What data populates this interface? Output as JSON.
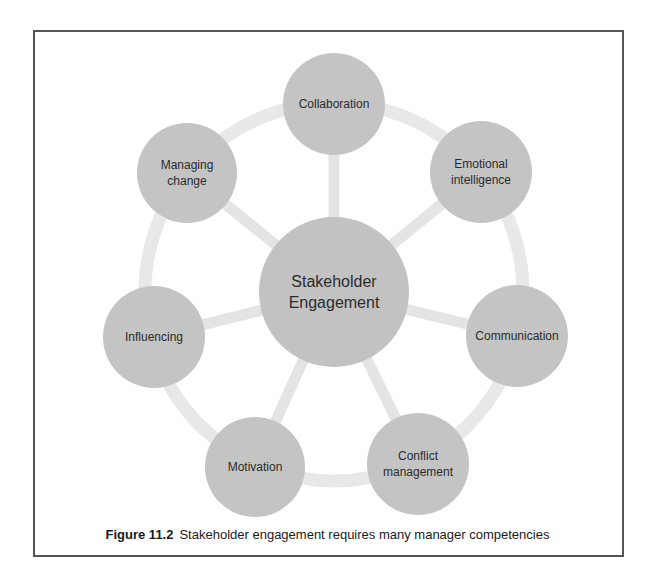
{
  "diagram": {
    "type": "hub-and-spoke",
    "center_node": {
      "label": "Stakeholder\nEngagement",
      "cx": 334,
      "cy": 292,
      "r": 75
    },
    "ring": {
      "cx": 334,
      "cy": 292,
      "r": 189,
      "stroke_width": 13
    },
    "nodes": [
      {
        "id": "collaboration",
        "label": "Collaboration",
        "cx": 334,
        "cy": 104,
        "r": 51
      },
      {
        "id": "emotional-intelligence",
        "label": "Emotional\nintelligence",
        "cx": 481,
        "cy": 172,
        "r": 51
      },
      {
        "id": "communication",
        "label": "Communication",
        "cx": 517,
        "cy": 336,
        "r": 51
      },
      {
        "id": "conflict-management",
        "label": "Conflict\nmanagement",
        "cx": 418,
        "cy": 464,
        "r": 51
      },
      {
        "id": "motivation",
        "label": "Motivation",
        "cx": 255,
        "cy": 467,
        "r": 50
      },
      {
        "id": "influencing",
        "label": "Influencing",
        "cx": 154,
        "cy": 337,
        "r": 51
      },
      {
        "id": "managing-change",
        "label": "Managing\nchange",
        "cx": 187,
        "cy": 173,
        "r": 50
      }
    ],
    "colors": {
      "node_fill": "#c4c4c4",
      "center_fill": "#c2c2c2",
      "ring": "#e8e8e8",
      "spoke": "#e4e4e4",
      "text": "#2b2b2b",
      "frame": "#555555"
    }
  },
  "caption": {
    "figure_number": "Figure 11.2",
    "text": "Stakeholder engagement requires many manager competencies"
  }
}
